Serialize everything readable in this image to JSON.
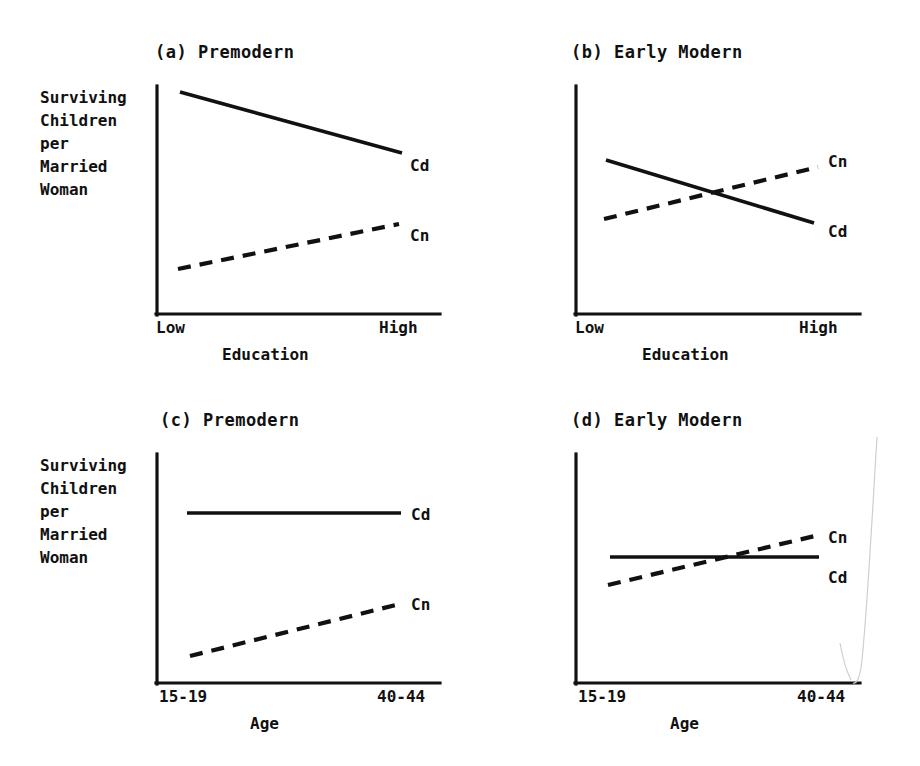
{
  "figure": {
    "background_color": "#ffffff",
    "ink_color": "#111111",
    "width": 920,
    "height": 766
  },
  "panels": [
    {
      "id": "a",
      "title": "(a) Premodern",
      "ylabel": "Surviving\nChildren\nper\nMarried\nWoman",
      "xlabel": "Education",
      "xticks": [
        "Low",
        "High"
      ],
      "series_labels": {
        "cd": "Cd",
        "cn": "Cn"
      }
    },
    {
      "id": "b",
      "title": "(b) Early Modern",
      "ylabel": "",
      "xlabel": "Education",
      "xticks": [
        "Low",
        "High"
      ],
      "series_labels": {
        "cn": "Cn",
        "cd": "Cd"
      }
    },
    {
      "id": "c",
      "title": "(c) Premodern",
      "ylabel": "Surviving\nChildren\nper\nMarried\nWoman",
      "xlabel": "Age",
      "xticks": [
        "15-19",
        "40-44"
      ],
      "series_labels": {
        "cd": "Cd",
        "cn": "Cn"
      }
    },
    {
      "id": "d",
      "title": "(d) Early Modern",
      "ylabel": "",
      "xlabel": "Age",
      "xticks": [
        "15-19",
        "40-44"
      ],
      "series_labels": {
        "cn": "Cn",
        "cd": "Cd"
      }
    }
  ],
  "chart_data": [
    {
      "type": "line",
      "panel": "a",
      "title": "(a) Premodern",
      "xlabel": "Education",
      "ylabel": "Surviving Children per Married Woman",
      "x": [
        "Low",
        "High"
      ],
      "xlim": [
        0,
        1
      ],
      "ylim": [
        0,
        1
      ],
      "grid": false,
      "legend": "inline-right",
      "series": [
        {
          "name": "Cd",
          "style": "solid",
          "x": [
            0.11,
            0.99
          ],
          "values": [
            0.97,
            0.7
          ]
        },
        {
          "name": "Cn",
          "style": "dashed",
          "x": [
            0.1,
            0.98
          ],
          "values": [
            0.2,
            0.39
          ]
        }
      ],
      "annotations": [
        "Cd",
        "Cn"
      ]
    },
    {
      "type": "line",
      "panel": "b",
      "title": "(b) Early Modern",
      "xlabel": "Education",
      "ylabel": "",
      "x": [
        "Low",
        "High"
      ],
      "xlim": [
        0,
        1
      ],
      "ylim": [
        0,
        1
      ],
      "grid": false,
      "legend": "inline-right",
      "series": [
        {
          "name": "Cd",
          "style": "solid",
          "x": [
            0.13,
            0.99
          ],
          "values": [
            0.67,
            0.4
          ]
        },
        {
          "name": "Cn",
          "style": "dashed",
          "x": [
            0.12,
            0.99
          ],
          "values": [
            0.42,
            0.65
          ]
        }
      ],
      "annotations": [
        "Cn",
        "Cd"
      ],
      "note": "Cd and Cn cross near the midpoint of the education range"
    },
    {
      "type": "line",
      "panel": "c",
      "title": "(c) Premodern",
      "xlabel": "Age",
      "ylabel": "Surviving Children per Married Woman",
      "x": [
        "15-19",
        "40-44"
      ],
      "xlim": [
        0,
        1
      ],
      "ylim": [
        0,
        1
      ],
      "grid": false,
      "legend": "inline-right",
      "series": [
        {
          "name": "Cd",
          "style": "solid",
          "x": [
            0.12,
            0.98
          ],
          "values": [
            0.74,
            0.74
          ]
        },
        {
          "name": "Cn",
          "style": "dashed",
          "x": [
            0.13,
            0.98
          ],
          "values": [
            0.1,
            0.32
          ]
        }
      ],
      "annotations": [
        "Cd",
        "Cn"
      ]
    },
    {
      "type": "line",
      "panel": "d",
      "title": "(d) Early Modern",
      "xlabel": "Age",
      "ylabel": "",
      "x": [
        "15-19",
        "40-44"
      ],
      "xlim": [
        0,
        1
      ],
      "ylim": [
        0,
        1
      ],
      "grid": false,
      "legend": "inline-right",
      "series": [
        {
          "name": "Cd",
          "style": "solid",
          "x": [
            0.14,
            0.99
          ],
          "values": [
            0.53,
            0.53
          ]
        },
        {
          "name": "Cn",
          "style": "dashed",
          "x": [
            0.13,
            0.99
          ],
          "values": [
            0.41,
            0.62
          ]
        }
      ],
      "annotations": [
        "Cn",
        "Cd"
      ],
      "note": "Cn crosses the flat Cd line at roughly two-thirds of the age range"
    }
  ]
}
